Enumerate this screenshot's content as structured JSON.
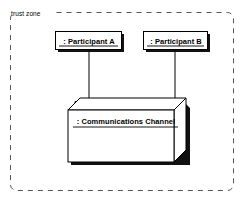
{
  "diagram": {
    "type": "uml-deployment-diagram",
    "boundary": {
      "label": "trust zone",
      "style": "dashed-rounded-rectangle"
    },
    "nodes": [
      {
        "id": "participant-a",
        "label": ": Participant A",
        "shape": "object-box",
        "underlined": true,
        "shadow": true
      },
      {
        "id": "participant-b",
        "label": ": Participant B",
        "shape": "object-box",
        "underlined": true,
        "shadow": true
      },
      {
        "id": "communications-channel",
        "label": ": Communications Channel",
        "shape": "3d-node-box",
        "underlined": true,
        "shadow": true
      }
    ],
    "connectors": [
      {
        "id": "connector-a",
        "from": "participant-a",
        "to": "communications-channel"
      },
      {
        "id": "connector-b",
        "from": "participant-b",
        "to": "communications-channel"
      }
    ],
    "colors": {
      "stroke": "#000000",
      "fill": "#ffffff",
      "shadow": "#000000",
      "background": "#ffffff",
      "boundary_stroke": "#555555"
    }
  }
}
